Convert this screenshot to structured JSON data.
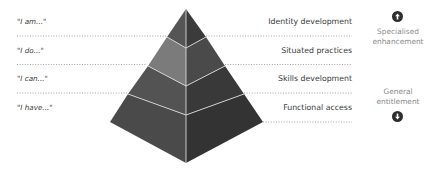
{
  "left_labels": [
    "\"I am...\"",
    "\"I do...\"",
    "\"I can...\"",
    "\"I have...\""
  ],
  "right_labels": [
    "Identity development",
    "Situated practices",
    "Skills development",
    "Functional access"
  ],
  "side": {
    "top_label_line1": "Specialised",
    "top_label_line2": "enhancement",
    "bottom_label_line1": "General",
    "bottom_label_line2": "entitlement",
    "top_icon": "arrow-up-circle-icon",
    "bottom_icon": "arrow-down-circle-icon"
  },
  "colors": {
    "band1_left": "#555555",
    "band1_right": "#3b3b3b",
    "band2_left": "#7b7b7b",
    "band2_right": "#4a4a4a",
    "band3_left": "#535353",
    "band3_right": "#393939",
    "band4_left": "#4a4a4a",
    "band4_right": "#333333",
    "divider": "#d8d8d8",
    "dots": "#8c8c8c"
  }
}
